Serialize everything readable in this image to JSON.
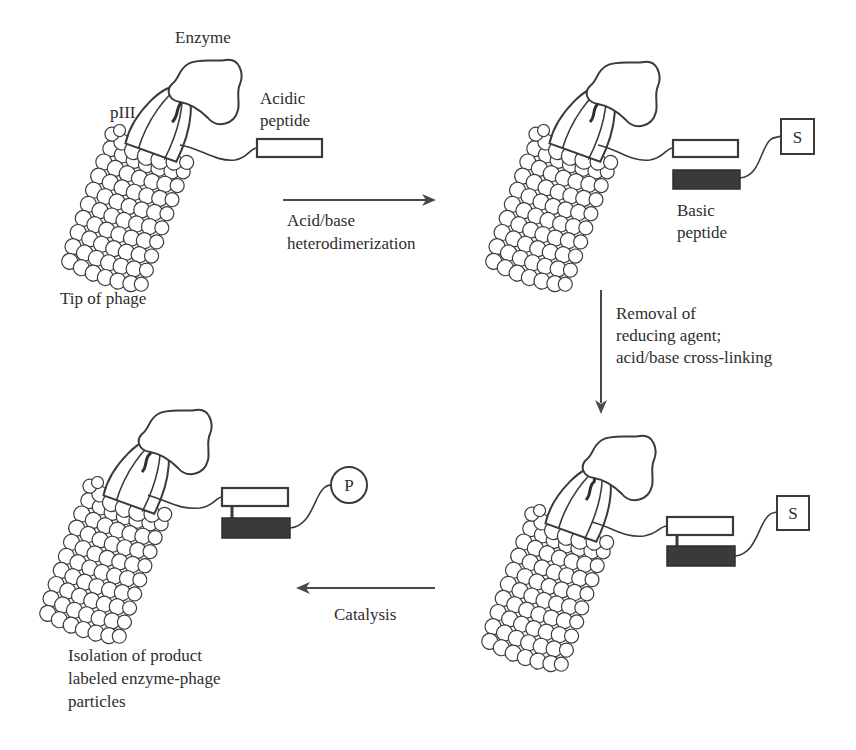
{
  "figure": {
    "type": "process-flow",
    "panels": [
      {
        "id": "panel-1",
        "position": "top-left",
        "labels": {
          "enzyme": "Enzyme",
          "piii": "pIII",
          "acidic_line1": "Acidic",
          "acidic_line2": "peptide",
          "tip_of_phage": "Tip of phage"
        }
      },
      {
        "id": "panel-2",
        "position": "top-right",
        "labels": {
          "substrate": "S",
          "basic_line1": "Basic",
          "basic_line2": "peptide"
        }
      },
      {
        "id": "panel-3",
        "position": "bottom-right",
        "labels": {
          "substrate": "S"
        }
      },
      {
        "id": "panel-4",
        "position": "bottom-left",
        "labels": {
          "product": "P",
          "caption_line1": "Isolation of product",
          "caption_line2": "labeled enzyme-phage",
          "caption_line3": "particles"
        }
      }
    ],
    "steps": [
      {
        "from": "panel-1",
        "to": "panel-2",
        "direction": "right",
        "label_line1": "Acid/base",
        "label_line2": "heterodimerization"
      },
      {
        "from": "panel-2",
        "to": "panel-3",
        "direction": "down",
        "label_line1": "Removal of",
        "label_line2": "reducing agent;",
        "label_line3": "acid/base cross-linking"
      },
      {
        "from": "panel-3",
        "to": "panel-4",
        "direction": "left",
        "label_line1": "Catalysis"
      }
    ],
    "colors": {
      "line": "#3a3a3a",
      "basic_peptide_fill": "#3a3a3a",
      "acidic_peptide_fill": "#ffffff",
      "background": "#ffffff"
    }
  }
}
